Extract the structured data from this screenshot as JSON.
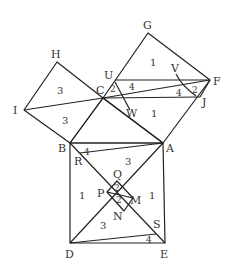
{
  "diagram": {
    "stroke_color": "#222222",
    "text_color": "#333333",
    "background": "#ffffff",
    "points": {
      "A": [
        163,
        143
      ],
      "B": [
        70,
        143
      ],
      "C": [
        103,
        98
      ],
      "D": [
        70,
        243
      ],
      "E": [
        165,
        243
      ],
      "F": [
        210,
        80
      ],
      "G": [
        148,
        33
      ],
      "H": [
        57,
        62
      ],
      "I": [
        24,
        110
      ],
      "J": [
        200,
        97
      ],
      "U": [
        115,
        80
      ],
      "V": [
        188,
        88
      ],
      "W": [
        128,
        98
      ],
      "M": [
        133,
        198
      ],
      "N": [
        124,
        211
      ],
      "P": [
        107,
        192
      ],
      "Q": [
        117,
        181
      ],
      "R": [
        80,
        152
      ],
      "S": [
        156,
        236
      ]
    },
    "vertex_labels": [
      {
        "text": "G",
        "x": 143,
        "y": 29
      },
      {
        "text": "H",
        "x": 51,
        "y": 58
      },
      {
        "text": "U",
        "x": 104,
        "y": 79
      },
      {
        "text": "V",
        "x": 171,
        "y": 72
      },
      {
        "text": "F",
        "x": 213,
        "y": 85
      },
      {
        "text": "I",
        "x": 13,
        "y": 114
      },
      {
        "text": "C",
        "x": 96,
        "y": 94
      },
      {
        "text": "J",
        "x": 202,
        "y": 106
      },
      {
        "text": "W",
        "x": 128,
        "y": 115
      },
      {
        "text": "B",
        "x": 58,
        "y": 152
      },
      {
        "text": "A",
        "x": 166,
        "y": 152
      },
      {
        "text": "R",
        "x": 74,
        "y": 165
      },
      {
        "text": "Q",
        "x": 113,
        "y": 178
      },
      {
        "text": "P",
        "x": 98,
        "y": 196
      },
      {
        "text": "M",
        "x": 130,
        "y": 202
      },
      {
        "text": "N",
        "x": 113,
        "y": 219
      },
      {
        "text": "S",
        "x": 154,
        "y": 227
      },
      {
        "text": "D",
        "x": 65,
        "y": 257
      },
      {
        "text": "E",
        "x": 160,
        "y": 257
      }
    ],
    "region_numbers": [
      {
        "text": "1",
        "x": 150,
        "y": 66
      },
      {
        "text": "3",
        "x": 57,
        "y": 94
      },
      {
        "text": "2",
        "x": 113,
        "y": 93
      },
      {
        "text": "4",
        "x": 130,
        "y": 90
      },
      {
        "text": "4",
        "x": 178,
        "y": 97
      },
      {
        "text": "2",
        "x": 193,
        "y": 94
      },
      {
        "text": "1",
        "x": 150,
        "y": 117
      },
      {
        "text": "3",
        "x": 62,
        "y": 123
      },
      {
        "text": "4",
        "x": 84,
        "y": 155
      },
      {
        "text": "3",
        "x": 125,
        "y": 164
      },
      {
        "text": "1",
        "x": 80,
        "y": 196
      },
      {
        "text": "2",
        "x": 117,
        "y": 191
      },
      {
        "text": "2",
        "x": 116,
        "y": 202
      },
      {
        "text": "1",
        "x": 148,
        "y": 196
      },
      {
        "text": "3",
        "x": 100,
        "y": 228
      },
      {
        "text": "4",
        "x": 146,
        "y": 244
      }
    ]
  }
}
